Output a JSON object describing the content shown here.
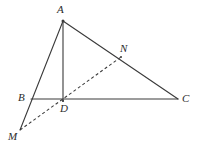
{
  "figure": {
    "width": 197,
    "height": 148,
    "background_color": "#ffffff",
    "stroke_color": "#3a3a3a",
    "label_color": "#2b2b2b",
    "stroke_width": 1.1,
    "dash_pattern": "3 2.5"
  },
  "points": {
    "A": {
      "label": "A",
      "x": 63,
      "y": 21,
      "label_x": 57,
      "label_y": 4
    },
    "B": {
      "label": "B",
      "x": 31,
      "y": 99,
      "label_x": 18,
      "label_y": 92
    },
    "C": {
      "label": "C",
      "x": 178,
      "y": 99,
      "label_x": 182,
      "label_y": 93
    },
    "D": {
      "label": "D",
      "x": 63,
      "y": 101,
      "label_x": 60,
      "label_y": 103
    },
    "M": {
      "label": "M",
      "x": 20,
      "y": 130,
      "label_x": 8,
      "label_y": 131
    },
    "N": {
      "label": "N",
      "x": 121,
      "y": 57,
      "label_x": 120,
      "label_y": 43
    }
  },
  "segments": {
    "solid": [
      {
        "name": "segment-A-M",
        "from": "A",
        "to": "M",
        "style": "solid"
      },
      {
        "name": "segment-A-D",
        "from": "A",
        "to": "D",
        "style": "solid"
      },
      {
        "name": "segment-A-C",
        "from": "A",
        "to": "C",
        "style": "solid"
      },
      {
        "name": "segment-B-C",
        "from": "B",
        "to": "C",
        "style": "solid"
      }
    ],
    "dashed": [
      {
        "name": "segment-M-N",
        "from": "M",
        "to": "N",
        "style": "dashed"
      }
    ]
  },
  "paths": {
    "line_A_M": "M 63 21 L 20 130",
    "line_A_D": "M 63 21 L 63 101",
    "line_A_C": "M 63 21 L 178 99",
    "line_B_C": "M 31 99 L 178 99",
    "line_M_N": "M 20 130 L 121 57"
  }
}
